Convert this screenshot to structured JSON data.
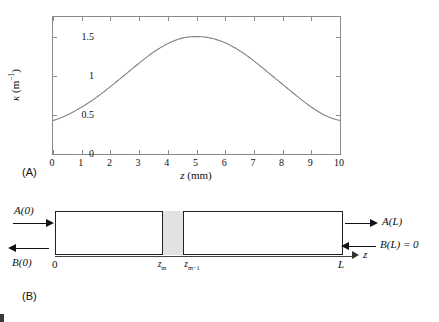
{
  "figure": {
    "panel_a_tag": "(A)",
    "panel_b_tag": "(B)"
  },
  "chart_data": {
    "type": "line",
    "title": "",
    "xlabel": "z (mm)",
    "ylabel": "κ (m⁻¹)",
    "xlim": [
      0,
      10
    ],
    "ylim": [
      0,
      1.75
    ],
    "grid": false,
    "legend": false,
    "x_ticks": [
      "0",
      "1",
      "2",
      "3",
      "4",
      "5",
      "6",
      "7",
      "8",
      "9",
      "10"
    ],
    "x_tick_values": [
      0,
      1,
      2,
      3,
      4,
      5,
      6,
      7,
      8,
      9,
      10
    ],
    "y_ticks": [
      "0",
      "0.5",
      "1",
      "1.5"
    ],
    "y_tick_values": [
      0,
      0.5,
      1,
      1.5
    ],
    "series": [
      {
        "name": "coupling coefficient",
        "color": "#808080",
        "description": "raised-cosine apodization profile peaking near z = 5 mm",
        "x": [
          0,
          0.5,
          1,
          1.5,
          2,
          2.5,
          3,
          3.5,
          4,
          4.5,
          5,
          5.5,
          6,
          6.5,
          7,
          7.5,
          8,
          8.5,
          9,
          9.5,
          10
        ],
        "y": [
          0.43,
          0.5,
          0.6,
          0.72,
          0.86,
          1.01,
          1.16,
          1.3,
          1.41,
          1.48,
          1.5,
          1.48,
          1.42,
          1.32,
          1.19,
          1.04,
          0.89,
          0.74,
          0.6,
          0.49,
          0.43
        ]
      }
    ]
  },
  "diagram": {
    "x_axis_label": "z",
    "left_top_label": "A(0)",
    "left_bottom_label": "B(0)",
    "right_top_label": "A(L)",
    "right_bottom_label": "B(L) = 0",
    "origin_label": "0",
    "end_label": "L",
    "slab_left_label_base": "z",
    "slab_left_label_sub": "m",
    "slab_right_label_base": "z",
    "slab_right_label_sub": "m−1",
    "slab_fill_color": "#e2e2e2",
    "box_border_color": "#222222"
  }
}
